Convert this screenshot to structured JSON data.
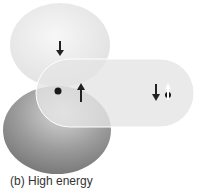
{
  "diagram": {
    "caption": "(b) High energy",
    "labels": {
      "top_lobe_spin": "down",
      "center_dot": "electron",
      "center_spin": "up",
      "right_spins": [
        "down",
        "up"
      ]
    },
    "colors": {
      "top_lobe": "#ececec",
      "bottom_lobe": "#9a9a9a",
      "orbital": "#e6e6e6",
      "arrow": "#222222",
      "arrow_white": "#ffffff"
    }
  }
}
